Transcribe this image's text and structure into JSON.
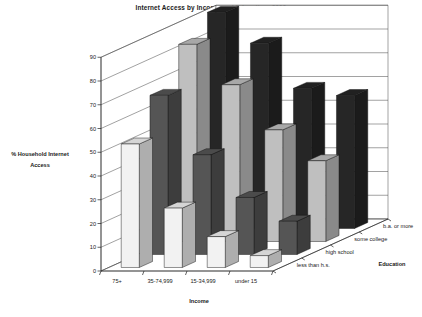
{
  "chart_data": {
    "type": "bar",
    "title": "Internet Access by Income and Education, 2000",
    "xlabel": "Income",
    "zlabel": "Education",
    "ylabel": "% Household Internet Access",
    "ylabel_line1": "% Household Internet",
    "ylabel_line2": "Access",
    "ylim": [
      0,
      90
    ],
    "yticks": [
      0,
      10,
      20,
      30,
      40,
      50,
      60,
      70,
      80,
      90
    ],
    "grid": true,
    "legend": "none",
    "projection": "3d",
    "categories": [
      "75+",
      "35-74,999",
      "15-34,999",
      "under 15"
    ],
    "depth_categories": [
      "less than h.s.",
      "high school",
      "some college",
      "b.a. or more"
    ],
    "series": [
      {
        "name": "less than h.s.",
        "color": "#f2f2f2",
        "values": [
          52,
          25,
          13,
          5
        ]
      },
      {
        "name": "high school",
        "color": "#555555",
        "values": [
          67,
          42,
          24,
          14
        ]
      },
      {
        "name": "some college",
        "color": "#bfbfbf",
        "values": [
          83,
          66,
          47,
          34
        ]
      },
      {
        "name": "b.a. or more",
        "color": "#262626",
        "values": [
          91,
          78,
          59,
          56
        ]
      }
    ]
  },
  "axis": {
    "title": "Internet Access by Income and Education, 2000",
    "y_label_1": "% Household Internet",
    "y_label_2": "Access",
    "x_label": "Income",
    "z_label": "Education",
    "y_ticks": [
      "90",
      "80",
      "70",
      "60",
      "50",
      "40",
      "30",
      "20",
      "10",
      "0"
    ],
    "x_ticks": [
      "75+",
      "35-74,999",
      "15-34,999",
      "under 15"
    ],
    "z_ticks": [
      "b.a. or more",
      "some college",
      "high school",
      "less than h.s."
    ]
  }
}
